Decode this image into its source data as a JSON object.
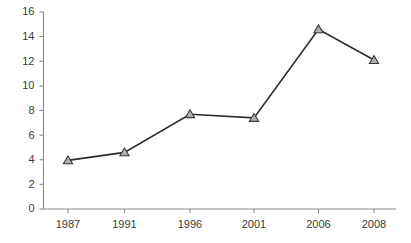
{
  "chart_data": {
    "type": "line",
    "title": "",
    "subtitle": "",
    "xlabel": "",
    "ylabel": "",
    "categories": [
      "1987",
      "1991",
      "1996",
      "2001",
      "2006",
      "2008"
    ],
    "x": [
      1987,
      1991,
      1996,
      2001,
      2006,
      2008
    ],
    "values": [
      3.95,
      4.6,
      7.7,
      7.4,
      14.6,
      12.1
    ],
    "series": [
      {
        "name": "series-1",
        "values": [
          3.95,
          4.6,
          7.7,
          7.4,
          14.6,
          12.1
        ],
        "marker": "triangle-up",
        "marker_fill": "#b0b0b0",
        "marker_edge": "#3a3a3a",
        "line_color": "#2b2b2b"
      }
    ],
    "ylim": [
      0,
      16
    ],
    "yticks": [
      0,
      2,
      4,
      6,
      8,
      10,
      12,
      14,
      16
    ],
    "ytick_labels": [
      "0",
      "2",
      "4",
      "6",
      "8",
      "10",
      "12",
      "14",
      "16"
    ],
    "xtick_labels": [
      "1987",
      "1991",
      "1996",
      "2001",
      "2006",
      "2008"
    ],
    "grid": false,
    "legend": false,
    "legend_position": "none",
    "annotations": [],
    "axis_color": "#8a8a8a",
    "text_color": "#3b3b3b",
    "background": "#ffffff"
  },
  "axes": {
    "y_axis_name": "y-axis",
    "x_axis_name": "x-axis"
  }
}
